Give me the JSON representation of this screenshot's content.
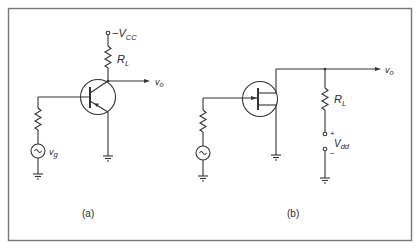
{
  "figure": {
    "type": "circuit-schematic",
    "panels": [
      {
        "id": "a",
        "caption": "(a)",
        "device": "bipolar-transistor",
        "supply": {
          "sign": "−",
          "symbol": "V",
          "subscript": "CC"
        },
        "load": {
          "symbol": "R",
          "subscript": "L"
        },
        "output": {
          "symbol": "v",
          "subscript": "o"
        },
        "source": {
          "symbol": "v",
          "subscript": "g"
        }
      },
      {
        "id": "b",
        "caption": "(b)",
        "device": "field-effect-transistor",
        "load": {
          "symbol": "R",
          "subscript": "L"
        },
        "output": {
          "symbol": "v",
          "subscript": "o"
        },
        "supply": {
          "plus": "+",
          "minus": "−",
          "symbol": "V",
          "subscript": "dd"
        }
      }
    ]
  },
  "colors": {
    "line": "#333333",
    "frame": "#777777",
    "background": "#ffffff"
  }
}
